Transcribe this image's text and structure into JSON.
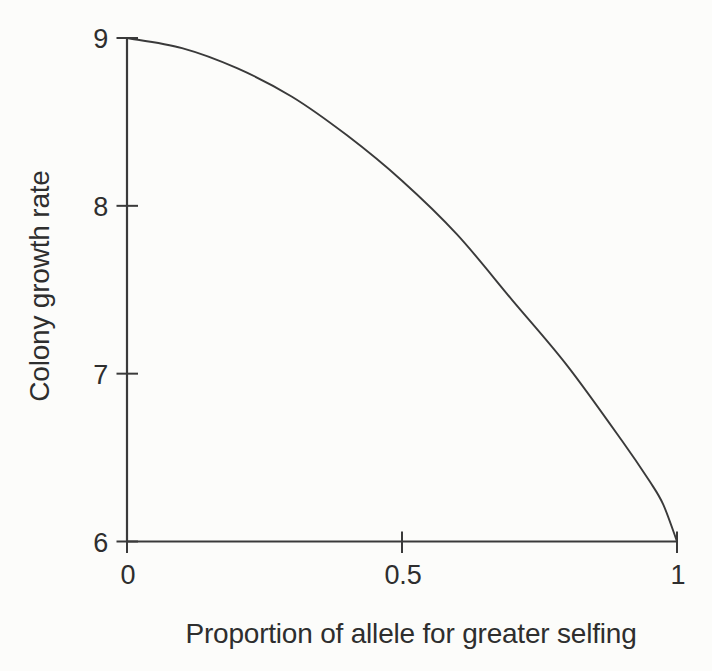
{
  "figure": {
    "background": "#fcfcfa",
    "ink": "#3a3a3a"
  },
  "chart_data": {
    "type": "line",
    "title": "",
    "xlabel": "Proportion of allele for greater selfing",
    "ylabel": "Colony growth rate",
    "xlim": [
      0,
      1
    ],
    "ylim": [
      6,
      9
    ],
    "grid": false,
    "legend": null,
    "x_ticks": [
      {
        "value": 0,
        "label": "0"
      },
      {
        "value": 0.5,
        "label": "0.5"
      },
      {
        "value": 1,
        "label": "1"
      }
    ],
    "y_ticks": [
      {
        "value": 9,
        "label": "9"
      },
      {
        "value": 8,
        "label": "8"
      },
      {
        "value": 7,
        "label": "7"
      },
      {
        "value": 6,
        "label": "6"
      }
    ],
    "series": [
      {
        "name": "colony-growth-rate-curve",
        "x": [
          0,
          0.1,
          0.2,
          0.3,
          0.4,
          0.5,
          0.6,
          0.7,
          0.8,
          0.9,
          0.95,
          0.975,
          1.0
        ],
        "y": [
          9.0,
          8.94,
          8.82,
          8.65,
          8.42,
          8.15,
          7.83,
          7.44,
          7.05,
          6.6,
          6.36,
          6.22,
          6.0
        ]
      }
    ]
  }
}
